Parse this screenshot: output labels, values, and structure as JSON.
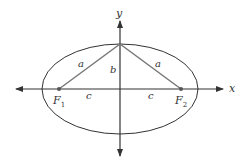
{
  "diagram": {
    "axes": {
      "x_label": "x",
      "y_label": "y"
    },
    "foci": [
      {
        "label": "F",
        "subscript": "1"
      },
      {
        "label": "F",
        "subscript": "2"
      }
    ],
    "segment_labels": {
      "left_hypotenuse": "a",
      "right_hypotenuse": "a",
      "semi_minor": "b",
      "left_focal": "c",
      "right_focal": "c"
    },
    "colors": {
      "stroke": "#333333",
      "triangle_stroke": "#777777",
      "background": "#ffffff"
    }
  }
}
